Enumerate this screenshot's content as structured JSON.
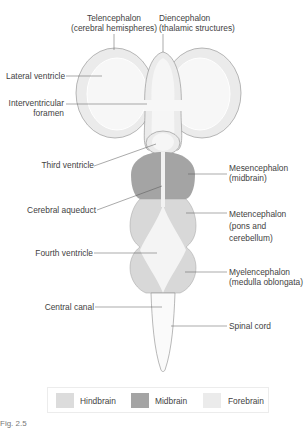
{
  "labels": {
    "telencephalon": [
      "Telencephalon",
      "(cerebral hemispheres)"
    ],
    "diencephalon": [
      "Diencephalon",
      "(thalamic structures)"
    ],
    "lateral_ventricle": "Lateral ventricle",
    "interventricular_foramen": [
      "Interventricular",
      "foramen"
    ],
    "third_ventricle": "Third ventricle",
    "mesencephalon": [
      "Mesencephalon",
      "(midbrain)"
    ],
    "cerebral_aqueduct": "Cerebral aqueduct",
    "metencephalon": [
      "Metencephalon",
      "(pons and",
      "cerebellum)"
    ],
    "fourth_ventricle": "Fourth ventricle",
    "myelencephalon": [
      "Myelencephalon",
      "(medulla oblongata)"
    ],
    "central_canal": "Central canal",
    "spinal_cord": "Spinal cord"
  },
  "legend": [
    {
      "label": "Hindbrain",
      "color": "#dcdcdc"
    },
    {
      "label": "Midbrain",
      "color": "#a4a4a4"
    },
    {
      "label": "Forebrain",
      "color": "#ebebeb"
    }
  ],
  "colors": {
    "forebrain": "#ebebeb",
    "forebrain_inner": "#f6f6f6",
    "midbrain": "#a4a4a4",
    "hindbrain": "#d6d6d6",
    "ventricle": "#f7f7f7",
    "outline": "#8a8a8a"
  },
  "caption": "Fig. 2.5"
}
